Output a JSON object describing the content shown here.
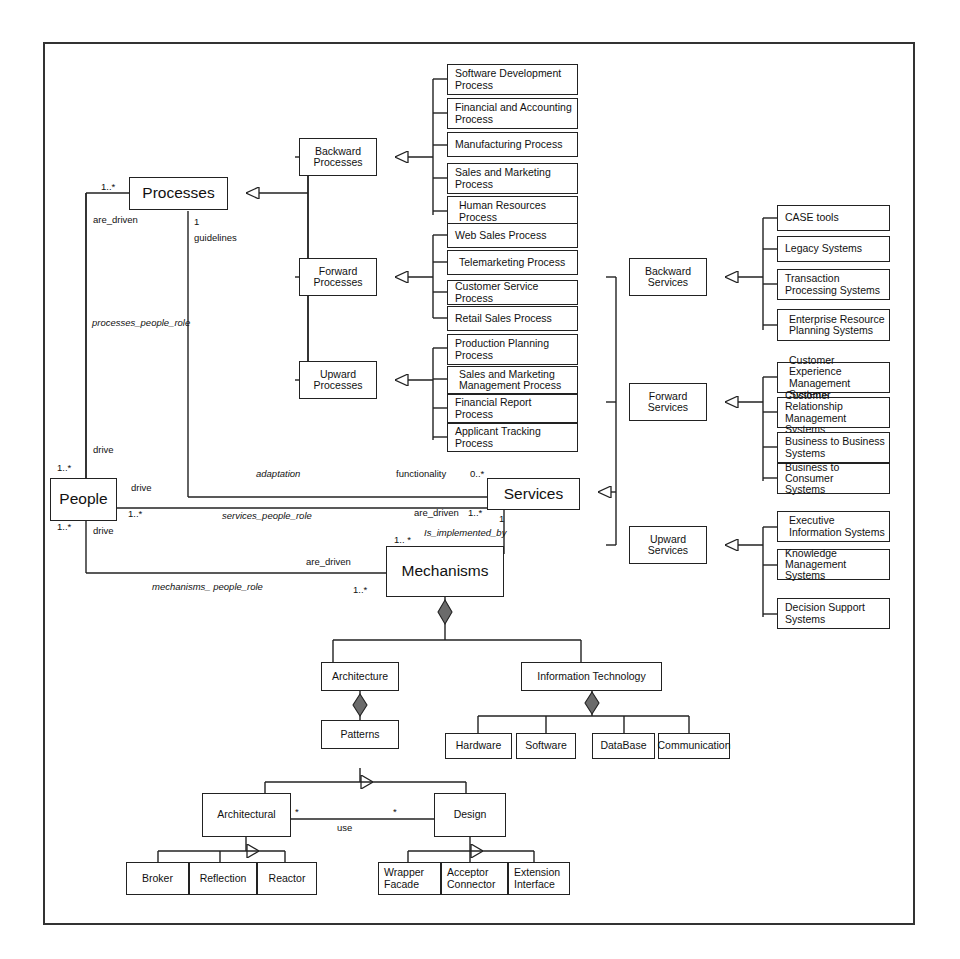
{
  "diagram": {
    "colors": {
      "line": "#222222",
      "fill": "#ffffff",
      "diamond": "#6b6b6b"
    }
  },
  "core": {
    "people": "People",
    "processes": "Processes",
    "services": "Services",
    "mechanisms": "Mechanisms"
  },
  "process_groups": [
    {
      "label": "Backward\nProcesses",
      "line1": "Backward",
      "line2": "Processes"
    },
    {
      "label": "Forward\nProcesses",
      "line1": "Forward",
      "line2": "Processes"
    },
    {
      "label": "Upward\nProcesses",
      "line1": "Upward",
      "line2": "Processes"
    }
  ],
  "service_groups": [
    {
      "line1": "Backward",
      "line2": "Services"
    },
    {
      "line1": "Forward",
      "line2": "Services"
    },
    {
      "line1": "Upward",
      "line2": "Services"
    }
  ],
  "backward_processes": [
    {
      "line1": "Software Development",
      "line2": "Process"
    },
    {
      "line1": "Financial and Accounting",
      "line2": "Process"
    },
    {
      "line1": "Manufacturing Process",
      "line2": ""
    },
    {
      "line1": "Sales and Marketing",
      "line2": "Process"
    },
    {
      "line1": "Human Resources",
      "line2": "Process"
    }
  ],
  "forward_processes": [
    {
      "line1": "Web Sales Process",
      "line2": ""
    },
    {
      "line1": "Telemarketing Process",
      "line2": ""
    },
    {
      "line1": "Customer Service Process",
      "line2": ""
    },
    {
      "line1": "Retail Sales Process",
      "line2": ""
    }
  ],
  "upward_processes": [
    {
      "line1": "Production Planning",
      "line2": "Process"
    },
    {
      "line1": "Sales and Marketing",
      "line2": "Management Process"
    },
    {
      "line1": "Financial Report",
      "line2": "Process"
    },
    {
      "line1": "Applicant Tracking",
      "line2": "Process"
    }
  ],
  "backward_services": [
    {
      "line1": "CASE tools",
      "line2": ""
    },
    {
      "line1": "Legacy Systems",
      "line2": ""
    },
    {
      "line1": "Transaction",
      "line2": "Processing Systems"
    },
    {
      "line1": "Enterprise Resource",
      "line2": "Planning Systems"
    }
  ],
  "forward_services": [
    {
      "line1": "Customer Experience",
      "line2": "Management Systems"
    },
    {
      "line1": "Customer Relationship",
      "line2": "Management Systems"
    },
    {
      "line1": "Business to Business",
      "line2": "Systems"
    },
    {
      "line1": "Business to Consumer",
      "line2": "Systems"
    }
  ],
  "upward_services": [
    {
      "line1": "Executive",
      "line2": "Information Systems"
    },
    {
      "line1": "Knowledge",
      "line2": "Management Systems"
    },
    {
      "line1": "Decision Support",
      "line2": "Systems"
    }
  ],
  "mechanism_tree": {
    "architecture": "Architecture",
    "information_technology": "Information Technology",
    "patterns": "Patterns",
    "it_children": [
      "Hardware",
      "Software",
      "DataBase",
      "Communication"
    ],
    "architectural": "Architectural",
    "design": "Design",
    "use_label": "use",
    "architectural_children": [
      "Broker",
      "Reflection",
      "Reactor"
    ],
    "design_children": [
      {
        "line1": "Wrapper",
        "line2": "Facade"
      },
      {
        "line1": "Acceptor",
        "line2": "Connector"
      },
      {
        "line1": "Extension",
        "line2": "Interface"
      }
    ]
  },
  "edge_labels": {
    "processes_mult": "1..*",
    "are_driven_processes": "are_driven",
    "guidelines_mult": "1",
    "guidelines": "guidelines",
    "processes_people_role": "processes_people_role",
    "drive_top": "drive",
    "people_mult_top": "1..*",
    "drive_mid": "drive",
    "people_mult_bottom": "1..*",
    "drive_bottom": "drive",
    "services_people_mult": "1..*",
    "adaptation": "adaptation",
    "functionality": "functionality",
    "functionality_mult": "0..*",
    "are_driven_services": "are_driven",
    "are_driven_services_mult": "1..*",
    "services_people_role": "services_people_role",
    "services_mult_one": "1",
    "is_implemented_by": "Is_implemented_by",
    "mechanisms_mult_top": "1.. *",
    "are_driven_mech": "are_driven",
    "mechanisms_people_role": "mechanisms_ people_role",
    "mechanisms_mult_bottom": "1..*",
    "star_left": "*",
    "star_right": "*"
  }
}
